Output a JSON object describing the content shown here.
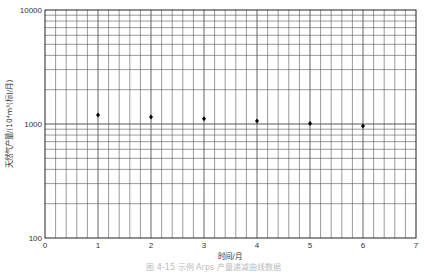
{
  "chart_data": {
    "type": "scatter",
    "title": "",
    "xlabel": "时间/月",
    "ylabel": "天然气产量/(10⁴m³(标)/月)",
    "x_ticks": [
      "0",
      "1",
      "2",
      "3",
      "4",
      "5",
      "6",
      "7"
    ],
    "y_ticks": [
      "100",
      "1000",
      "10000"
    ],
    "y_scale": "log",
    "xlim": [
      0,
      7
    ],
    "ylim": [
      100,
      10000
    ],
    "grid": true,
    "legend": "none",
    "series": [
      {
        "name": "产量",
        "x": [
          1,
          2,
          3,
          4,
          5,
          6
        ],
        "values": [
          1200,
          1150,
          1110,
          1060,
          1010,
          960
        ]
      }
    ],
    "caption": "图 4-15 示例 Arps 产量递减曲线数据"
  },
  "colors": {
    "grid": "#555555",
    "frame": "#222222",
    "marker": "#000000"
  }
}
